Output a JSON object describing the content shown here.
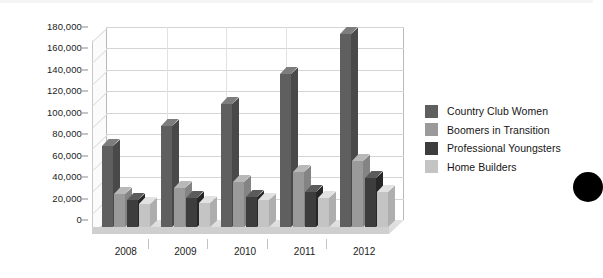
{
  "chart_data": {
    "type": "bar",
    "title": "",
    "xlabel": "",
    "ylabel": "",
    "categories": [
      "2008",
      "2009",
      "2010",
      "2011",
      "2012"
    ],
    "series": [
      {
        "name": "Country Club Women",
        "color": "#5f5f5f",
        "values": [
          76000,
          94000,
          115000,
          143000,
          180000
        ]
      },
      {
        "name": "Boomers in Transition",
        "color": "#9a9a9a",
        "values": [
          31000,
          36000,
          42000,
          51000,
          62000
        ]
      },
      {
        "name": "Professional Youngsters",
        "color": "#3d3d3d",
        "values": [
          25000,
          27000,
          28000,
          33000,
          46000
        ]
      },
      {
        "name": "Home Builders",
        "color": "#c4c4c4",
        "values": [
          21000,
          22000,
          25000,
          27000,
          33000
        ]
      }
    ],
    "ylim": [
      0,
      180000
    ],
    "ytick_values": [
      0,
      20000,
      40000,
      60000,
      80000,
      100000,
      120000,
      140000,
      160000,
      180000
    ],
    "ytick_labels": [
      "0",
      "20,000",
      "40,000",
      "60,000",
      "80,000",
      "100,000",
      "120,000",
      "140,000",
      "160,000",
      "180,000"
    ],
    "grid": true,
    "three_d": true,
    "legend_position": "right"
  },
  "legend": {
    "items": [
      {
        "label": "Country Club Women",
        "color": "#5f5f5f"
      },
      {
        "label": "Boomers in Transition",
        "color": "#9a9a9a"
      },
      {
        "label": "Professional Youngsters",
        "color": "#3d3d3d"
      },
      {
        "label": "Home Builders",
        "color": "#c4c4c4"
      }
    ]
  }
}
